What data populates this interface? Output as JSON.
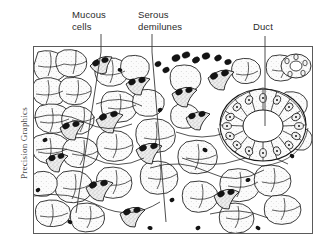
{
  "figure": {
    "kind": "histology-illustration",
    "frame": {
      "x": 33,
      "y": 46,
      "width": 280,
      "height": 188,
      "border_color": "#5a5a5a"
    },
    "background_color": "#ffffff",
    "ink_color": "#1a1a1a"
  },
  "callouts": [
    {
      "id": "mucous-cells",
      "label": "Mucous\ncells",
      "label_x": 72,
      "label_y": 9,
      "leader": {
        "x1": 101,
        "y1": 34,
        "x2": 101,
        "y2": 52,
        "x3": 76,
        "y3": 213
      }
    },
    {
      "id": "serous-demilunes",
      "label": "Serous\ndemilunes",
      "label_x": 138,
      "label_y": 9,
      "leader": {
        "x1": 152,
        "y1": 34,
        "x2": 152,
        "y2": 52,
        "x3": 166,
        "y3": 222
      }
    },
    {
      "id": "duct",
      "label": "Duct",
      "label_x": 253,
      "label_y": 21,
      "leader": {
        "x1": 265,
        "y1": 36,
        "x2": 265,
        "y2": 46,
        "x3": 265,
        "y3": 126
      }
    }
  ],
  "credit": {
    "text": "Precision Graphics",
    "orientation": "vertical-rotated-90"
  },
  "colors": {
    "ink": "#1a1a1a",
    "label_text": "#2b2b2b",
    "credit_text": "#4a4a4a",
    "frame_border": "#5a5a5a",
    "nucleus_fill": "#141414",
    "cytoplasm_fill": "#f4f4f4",
    "duct_lumen_fill": "#ffffff"
  }
}
